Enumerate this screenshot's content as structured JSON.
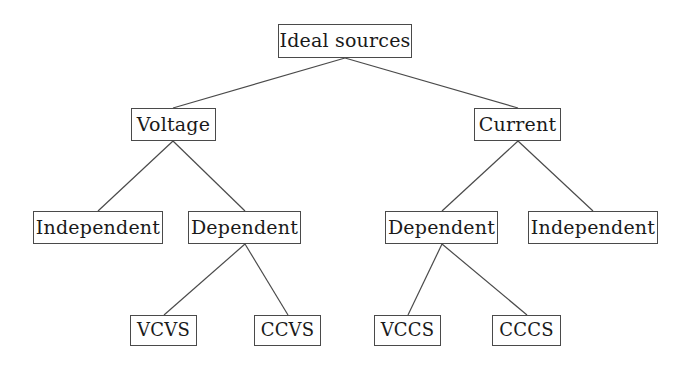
{
  "diagram": {
    "type": "tree",
    "background_color": "#ffffff",
    "box_border_color": "#4a4a4a",
    "edge_color": "#4a4a4a",
    "text_color": "#1a1a1a",
    "nodes": [
      {
        "id": "root",
        "label": "Ideal sources",
        "level": 0,
        "x": 278,
        "y": 24,
        "w": 134,
        "h": 34
      },
      {
        "id": "voltage",
        "label": "Voltage",
        "level": 1,
        "x": 131,
        "y": 108,
        "w": 85,
        "h": 33
      },
      {
        "id": "current",
        "label": "Current",
        "level": 1,
        "x": 474,
        "y": 108,
        "w": 87,
        "h": 33
      },
      {
        "id": "v-independent",
        "label": "Independent",
        "level": 2,
        "x": 33,
        "y": 211,
        "w": 130,
        "h": 33
      },
      {
        "id": "v-dependent",
        "label": "Dependent",
        "level": 2,
        "x": 188,
        "y": 211,
        "w": 113,
        "h": 33
      },
      {
        "id": "i-dependent",
        "label": "Dependent",
        "level": 2,
        "x": 385,
        "y": 211,
        "w": 113,
        "h": 33
      },
      {
        "id": "i-independent",
        "label": "Independent",
        "level": 2,
        "x": 528,
        "y": 211,
        "w": 130,
        "h": 33
      },
      {
        "id": "vcvs",
        "label": "VCVS",
        "level": 3,
        "x": 130,
        "y": 315,
        "w": 67,
        "h": 31
      },
      {
        "id": "ccvs",
        "label": "CCVS",
        "level": 3,
        "x": 254,
        "y": 315,
        "w": 67,
        "h": 31
      },
      {
        "id": "vccs",
        "label": "VCCS",
        "level": 3,
        "x": 374,
        "y": 315,
        "w": 67,
        "h": 31
      },
      {
        "id": "cccs",
        "label": "CCCS",
        "level": 3,
        "x": 492,
        "y": 315,
        "w": 69,
        "h": 31
      }
    ],
    "edges": [
      {
        "from": "root",
        "to": "voltage",
        "x1": 345,
        "y1": 58,
        "x2": 173,
        "y2": 108
      },
      {
        "from": "root",
        "to": "current",
        "x1": 345,
        "y1": 58,
        "x2": 518,
        "y2": 108
      },
      {
        "from": "voltage",
        "to": "v-independent",
        "x1": 173,
        "y1": 141,
        "x2": 98,
        "y2": 211
      },
      {
        "from": "voltage",
        "to": "v-dependent",
        "x1": 173,
        "y1": 141,
        "x2": 245,
        "y2": 211
      },
      {
        "from": "current",
        "to": "i-dependent",
        "x1": 518,
        "y1": 141,
        "x2": 442,
        "y2": 211
      },
      {
        "from": "current",
        "to": "i-independent",
        "x1": 518,
        "y1": 141,
        "x2": 593,
        "y2": 211
      },
      {
        "from": "v-dependent",
        "to": "vcvs",
        "x1": 245,
        "y1": 244,
        "x2": 164,
        "y2": 315
      },
      {
        "from": "v-dependent",
        "to": "ccvs",
        "x1": 245,
        "y1": 244,
        "x2": 288,
        "y2": 315
      },
      {
        "from": "i-dependent",
        "to": "vccs",
        "x1": 442,
        "y1": 244,
        "x2": 408,
        "y2": 315
      },
      {
        "from": "i-dependent",
        "to": "cccs",
        "x1": 442,
        "y1": 244,
        "x2": 527,
        "y2": 315
      }
    ]
  }
}
